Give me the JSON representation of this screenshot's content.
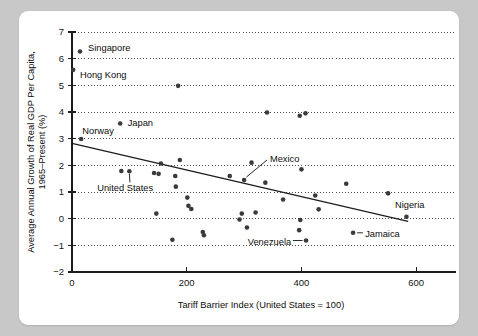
{
  "figure": {
    "background_color": "#c8c8c8",
    "card_color": "#ffffff",
    "point_color": "#3a3a3a",
    "line_color": "#1c1c1c"
  },
  "chart_data": {
    "type": "scatter",
    "title": "",
    "xlabel": "Tariff Barrier Index (United States = 100)",
    "ylabel": "Average Annual Growth of Real GDP Per Capita, 1965–Present (%)",
    "ylabel_line1": "Average Annual Growth of Real GDP Per Capita,",
    "ylabel_line2": "1965–Present (%)",
    "xlim": [
      0,
      645
    ],
    "ylim": [
      -2,
      7
    ],
    "xticks": [
      0,
      200,
      400,
      600
    ],
    "xtick_labels": [
      "0",
      "200",
      "400",
      "600"
    ],
    "yticks": [
      -2,
      -1,
      0,
      1,
      2,
      3,
      4,
      5,
      6,
      7
    ],
    "ytick_labels": [
      "−2",
      "−1",
      "0",
      "1",
      "2",
      "3",
      "4",
      "5",
      "6",
      "7"
    ],
    "grid": "horizontal-dotted",
    "legend": "none",
    "points": [
      {
        "x": 14,
        "y": 6.27,
        "label": "Singapore"
      },
      {
        "x": 2,
        "y": 5.58,
        "label": "Hong Kong"
      },
      {
        "x": 185,
        "y": 4.98,
        "label": ""
      },
      {
        "x": 340,
        "y": 3.98,
        "label": ""
      },
      {
        "x": 397,
        "y": 3.86,
        "label": ""
      },
      {
        "x": 407,
        "y": 3.95,
        "label": ""
      },
      {
        "x": 84,
        "y": 3.57,
        "label": "Japan"
      },
      {
        "x": 16,
        "y": 2.99,
        "label": "Norway"
      },
      {
        "x": 188,
        "y": 2.2,
        "label": ""
      },
      {
        "x": 155,
        "y": 2.07,
        "label": ""
      },
      {
        "x": 313,
        "y": 2.1,
        "label": ""
      },
      {
        "x": 400,
        "y": 1.85,
        "label": ""
      },
      {
        "x": 86,
        "y": 1.79,
        "label": ""
      },
      {
        "x": 100,
        "y": 1.78,
        "label": "United States"
      },
      {
        "x": 143,
        "y": 1.71,
        "label": ""
      },
      {
        "x": 151,
        "y": 1.68,
        "label": ""
      },
      {
        "x": 275,
        "y": 1.6,
        "label": ""
      },
      {
        "x": 180,
        "y": 1.6,
        "label": ""
      },
      {
        "x": 300,
        "y": 1.45,
        "label": "Mexico"
      },
      {
        "x": 337,
        "y": 1.35,
        "label": ""
      },
      {
        "x": 478,
        "y": 1.31,
        "label": ""
      },
      {
        "x": 181,
        "y": 1.2,
        "label": ""
      },
      {
        "x": 551,
        "y": 0.95,
        "label": ""
      },
      {
        "x": 424,
        "y": 0.87,
        "label": ""
      },
      {
        "x": 201,
        "y": 0.79,
        "label": ""
      },
      {
        "x": 368,
        "y": 0.72,
        "label": ""
      },
      {
        "x": 203,
        "y": 0.48,
        "label": ""
      },
      {
        "x": 208,
        "y": 0.36,
        "label": ""
      },
      {
        "x": 430,
        "y": 0.35,
        "label": ""
      },
      {
        "x": 320,
        "y": 0.23,
        "label": ""
      },
      {
        "x": 296,
        "y": 0.19,
        "label": ""
      },
      {
        "x": 147,
        "y": 0.19,
        "label": ""
      },
      {
        "x": 583,
        "y": 0.07,
        "label": "Nigeria"
      },
      {
        "x": 292,
        "y": -0.03,
        "label": ""
      },
      {
        "x": 398,
        "y": -0.05,
        "label": ""
      },
      {
        "x": 305,
        "y": -0.33,
        "label": ""
      },
      {
        "x": 396,
        "y": -0.43,
        "label": ""
      },
      {
        "x": 228,
        "y": -0.5,
        "label": ""
      },
      {
        "x": 230,
        "y": -0.62,
        "label": ""
      },
      {
        "x": 490,
        "y": -0.53,
        "label": "Jamaica"
      },
      {
        "x": 175,
        "y": -0.79,
        "label": ""
      },
      {
        "x": 408,
        "y": -0.82,
        "label": "Venezuela"
      }
    ],
    "trendline": {
      "x_start": 0,
      "y_start": 2.82,
      "x_end": 586,
      "y_end": -0.1
    },
    "annotations": [
      {
        "text": "Singapore",
        "anchor": "start",
        "tx": 28,
        "ty": 6.42,
        "leader": false
      },
      {
        "text": "Hong Kong",
        "anchor": "start",
        "tx": 14,
        "ty": 5.4,
        "leader": false
      },
      {
        "text": "Japan",
        "anchor": "start",
        "tx": 97,
        "ty": 3.62,
        "leader": false
      },
      {
        "text": "Norway",
        "anchor": "start",
        "tx": 18,
        "ty": 3.3,
        "leader": false
      },
      {
        "text": "United States",
        "anchor": "start",
        "tx": 44,
        "ty": 1.16,
        "leader": true,
        "lx1": 101,
        "ly1": 1.36,
        "lx2": 100,
        "ly2": 1.68
      },
      {
        "text": "Mexico",
        "anchor": "start",
        "tx": 345,
        "ty": 2.27,
        "leader": true,
        "lx1": 340,
        "ly1": 2.2,
        "lx2": 304,
        "ly2": 1.56
      },
      {
        "text": "Venezuela",
        "anchor": "end",
        "tx": 382,
        "ty": -0.86,
        "leader": true,
        "lx1": 385,
        "ly1": -0.82,
        "lx2": 402,
        "ly2": -0.82
      },
      {
        "text": "Jamaica",
        "anchor": "start",
        "tx": 511,
        "ty": -0.57,
        "leader": true,
        "lx1": 497,
        "ly1": -0.53,
        "lx2": 507,
        "ly2": -0.53
      },
      {
        "text": "Nigeria",
        "anchor": "start",
        "tx": 563,
        "ty": 0.52,
        "leader": false
      }
    ]
  }
}
